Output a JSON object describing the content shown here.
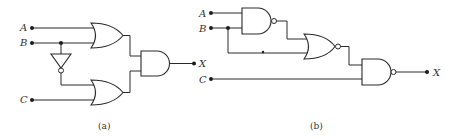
{
  "figure": {
    "panels": [
      {
        "id": "a",
        "caption": "(a)",
        "inputs": [
          "A",
          "B",
          "C"
        ],
        "output": "X",
        "gates": [
          {
            "type": "OR",
            "name": "or-gate-top",
            "inputs": [
              "A",
              "B"
            ]
          },
          {
            "type": "NOT",
            "name": "inverter",
            "inputs": [
              "B"
            ]
          },
          {
            "type": "OR",
            "name": "or-gate-bottom",
            "inputs": [
              "NOT B",
              "C"
            ]
          },
          {
            "type": "AND",
            "name": "and-gate",
            "inputs": [
              "or-top",
              "or-bottom"
            ]
          }
        ]
      },
      {
        "id": "b",
        "caption": "(b)",
        "inputs": [
          "A",
          "B",
          "C"
        ],
        "output": "X",
        "gates": [
          {
            "type": "NAND",
            "name": "nand-gate-1",
            "inputs": [
              "A",
              "B"
            ]
          },
          {
            "type": "NOR",
            "name": "nor-gate",
            "inputs": [
              "nand-1",
              "B"
            ]
          },
          {
            "type": "NAND",
            "name": "nand-gate-2",
            "inputs": [
              "nor",
              "C"
            ]
          }
        ]
      }
    ]
  },
  "labels": {
    "a_A": "A",
    "a_B": "B",
    "a_C": "C",
    "a_X": "X",
    "a_caption": "(a)",
    "b_A": "A",
    "b_B": "B",
    "b_C": "C",
    "b_X": "X",
    "b_caption": "(b)"
  }
}
